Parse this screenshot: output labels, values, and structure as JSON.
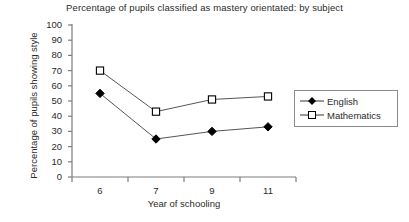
{
  "chart_data": {
    "type": "line",
    "title": "Percentage of pupils classified as mastery orientated: by subject",
    "xlabel": "Year of schooling",
    "ylabel": "Percentage of pupils showing style",
    "categories": [
      "6",
      "7",
      "9",
      "11"
    ],
    "ylim": [
      0,
      100
    ],
    "yticks": [
      "0",
      "10",
      "20",
      "30",
      "40",
      "50",
      "60",
      "70",
      "80",
      "90",
      "100"
    ],
    "grid": false,
    "legend_position": "right",
    "series": [
      {
        "name": "English",
        "marker": "filled-diamond",
        "color": "#000000",
        "values": [
          55,
          25,
          30,
          33
        ]
      },
      {
        "name": "Mathematics",
        "marker": "open-square",
        "color": "#000000",
        "values": [
          70,
          43,
          51,
          53
        ]
      }
    ]
  },
  "axis_color": "#7d7d7d",
  "text_color": "#2b2b2b"
}
